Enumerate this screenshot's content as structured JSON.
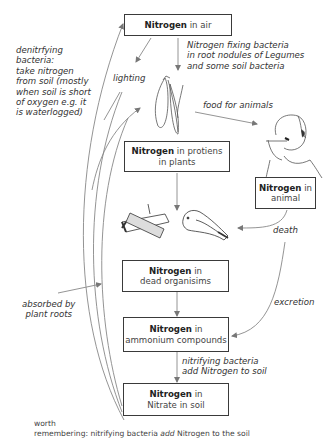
{
  "diagram": {
    "boxes": {
      "air": {
        "bold": "Nitrogen",
        "rest": " in air"
      },
      "plants": {
        "bold": "Nitrogen",
        "rest": " in protiens",
        "line2": "in plants"
      },
      "animal": {
        "bold": "Nitrogen",
        "rest": " in",
        "line2": "animal"
      },
      "dead": {
        "bold": "Nitrogen",
        "rest": " in",
        "line2": "dead organisims"
      },
      "ammonium": {
        "bold": "Nitrogen",
        "rest": " in",
        "line2": "ammonium compounds"
      },
      "nitrate": {
        "bold": "Nitrogen",
        "rest": " in",
        "line2": "Nitrate in soil"
      }
    },
    "labels": {
      "denitrifying": [
        "denitrfying",
        "bacteria:",
        "take nitrogen",
        "from soil (mostly",
        "when soil is short",
        "of oxygen e.g. it",
        "is waterlogged)"
      ],
      "lighting": "lighting",
      "fixing": [
        "Nitrogen fixing bacteria",
        "in root nodules of Legumes",
        "and some soil bacteria"
      ],
      "food": "food for animals",
      "death": "death",
      "absorbed": [
        "absorbed by",
        "plant roots"
      ],
      "excretion": "excretion",
      "nitrifying": [
        "nitrifying bacteria",
        "add Nitrogen to soil"
      ]
    },
    "illustrations": [
      "plant-icon",
      "person-eating-icon",
      "dead-wood-icon",
      "dead-bird-icon"
    ],
    "footer": {
      "line1": "worth",
      "line2_pre": "remembering: nitrifying bacteria ",
      "line2_em": "add",
      "line2_post": " Nitrogen to the soil"
    }
  }
}
